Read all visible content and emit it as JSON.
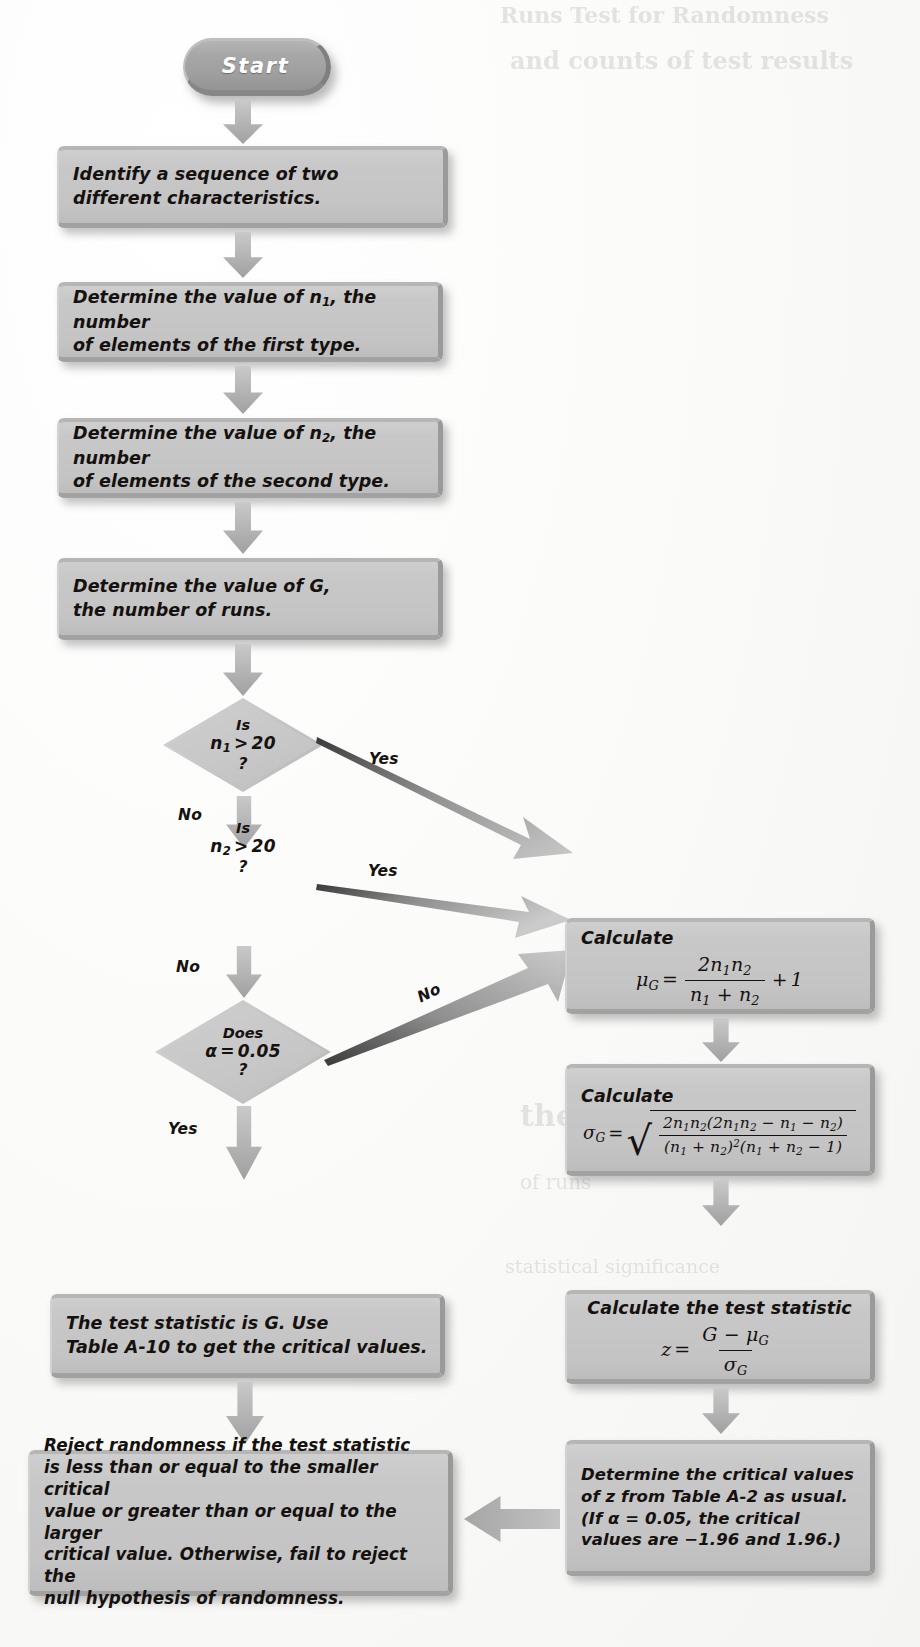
{
  "figure": {
    "type": "flowchart"
  },
  "palette": {
    "box_fill": "#c6c6c6",
    "terminator_fill": "#a4a4a4",
    "diamond_fill": "#c8c8c8",
    "arrow_fill": "#b4b4b4",
    "text": "#15110f",
    "terminator_text": "#ffffff",
    "page_bg": "#fbfbfa"
  },
  "nodes": {
    "start": {
      "label": "Start"
    },
    "step_identify": {
      "line1": "Identify a sequence of two",
      "line2": "different characteristics."
    },
    "step_n1": {
      "line1_a": "Determine the value of ",
      "line1_var": "n",
      "line1_sub": "1",
      "line1_b": ", the number",
      "line2": "of elements of the first type."
    },
    "step_n2": {
      "line1_a": "Determine the value of ",
      "line1_var": "n",
      "line1_sub": "2",
      "line1_b": ", the number",
      "line2": "of elements of the second type."
    },
    "step_G": {
      "line1_a": "Determine the value of ",
      "line1_var": "G",
      "line1_b": ",",
      "line2": "the number of runs."
    },
    "decision_n1": {
      "l1": "Is",
      "l2_var": "n",
      "l2_sub": "1",
      "l2_op": ">",
      "l2_val": "20",
      "l3": "?"
    },
    "decision_n2": {
      "l1": "Is",
      "l2_var": "n",
      "l2_sub": "2",
      "l2_op": ">",
      "l2_val": "20",
      "l3": "?"
    },
    "decision_alpha": {
      "l1": "Does",
      "l2_var": "α",
      "l2_op": "=",
      "l2_val": "0.05",
      "l3": "?"
    },
    "calc_mu": {
      "heading": "Calculate",
      "formula_text": "μ_G = 2n₁n₂/(n₁ + n₂) + 1",
      "lhs": "μ",
      "lhs_sub": "G",
      "eq": "=",
      "num": "2n₁n₂",
      "den": "n₁ + n₂",
      "tail": "+ 1"
    },
    "calc_sigma": {
      "heading": "Calculate",
      "formula_text": "σ_G = √[ 2n₁n₂(2n₁n₂ − n₁ − n₂) / ((n₁ + n₂)²(n₁ + n₂ − 1)) ]",
      "lhs": "σ",
      "lhs_sub": "G",
      "eq": "=",
      "num": "2n₁n₂(2n₁n₂ − n₁ − n₂)",
      "den": "(n₁ + n₂)²(n₁ + n₂ − 1)"
    },
    "calc_z": {
      "heading": "Calculate the test statistic",
      "formula_text": "z = (G − μ_G) / σ_G",
      "lhs": "z",
      "eq": "=",
      "num": "G − μ_G",
      "den": "σ_G"
    },
    "small_sample_result": {
      "line1_a": "The test statistic is ",
      "line1_var": "G",
      "line1_b": ". Use",
      "line2": "Table A-10 to get the critical values."
    },
    "critical_values_z": {
      "line1": "Determine the critical values",
      "line2": "of z from Table A-2 as usual.",
      "line3_a": "(If ",
      "line3_var": "α",
      "line3_b": " = 0.05, the critical",
      "line4": "values are −1.96 and 1.96.)"
    },
    "conclusion": {
      "line1": "Reject randomness if the test statistic",
      "line2": "is less than or equal to the smaller critical",
      "line3": "value or greater than or equal to the larger",
      "line4": "critical value. Otherwise, fail to reject the",
      "line5": "null hypothesis of randomness."
    }
  },
  "edges": {
    "n1_yes": "Yes",
    "n1_no": "No",
    "n2_yes": "Yes",
    "n2_no": "No",
    "alpha_no": "No",
    "alpha_yes": "Yes"
  },
  "bleed_text": {
    "b1": "Runs Test for Randomness",
    "b2": "and counts of test results",
    "b3": "statistical significance",
    "b4": "the Runs",
    "b5": "of runs"
  }
}
